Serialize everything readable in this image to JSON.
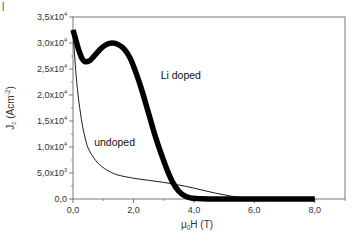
{
  "chart_data": {
    "type": "line",
    "title": "",
    "xlabel": "μ0H (T)",
    "xlabel_parts": {
      "base": "μ",
      "sub": "0",
      "rest": "H (T)"
    },
    "ylabel": "Jc (Acm-2)",
    "ylabel_parts": {
      "base": "J",
      "sub": "c",
      "mid": " (Acm",
      "sup": "-2",
      "end": ")"
    },
    "xlim": [
      0,
      9
    ],
    "ylim": [
      0,
      35000
    ],
    "grid": false,
    "legend": "none (inline annotations)",
    "x_ticks": [
      {
        "value": 0,
        "label": "0,0"
      },
      {
        "value": 2,
        "label": "2,0"
      },
      {
        "value": 4,
        "label": "4,0"
      },
      {
        "value": 6,
        "label": "6,0"
      },
      {
        "value": 8,
        "label": "8,0"
      }
    ],
    "y_ticks": [
      {
        "value": 0,
        "mant": "0,0",
        "exp": ""
      },
      {
        "value": 5000,
        "mant": "5,0x10",
        "exp": "3"
      },
      {
        "value": 10000,
        "mant": "1,0x10",
        "exp": "4"
      },
      {
        "value": 15000,
        "mant": "1,5x10",
        "exp": "4"
      },
      {
        "value": 20000,
        "mant": "2,0x10",
        "exp": "4"
      },
      {
        "value": 25000,
        "mant": "2,5x10",
        "exp": "4"
      },
      {
        "value": 30000,
        "mant": "3,0x10",
        "exp": "4"
      },
      {
        "value": 35000,
        "mant": "3,5x10",
        "exp": "4"
      }
    ],
    "series": [
      {
        "name": "Li doped",
        "style": "thick",
        "x": [
          0.0,
          0.1,
          0.2,
          0.3,
          0.4,
          0.55,
          0.7,
          0.9,
          1.1,
          1.3,
          1.5,
          1.7,
          1.9,
          2.1,
          2.3,
          2.5,
          2.7,
          2.9,
          3.1,
          3.3,
          3.5,
          3.7,
          3.9,
          4.1,
          4.5,
          5.0,
          6.0,
          7.0,
          8.0
        ],
        "values": [
          32500,
          30500,
          28500,
          27000,
          26400,
          26600,
          27500,
          28800,
          29700,
          30000,
          29700,
          28800,
          27000,
          24000,
          20500,
          16500,
          12500,
          9000,
          5800,
          3200,
          1500,
          600,
          200,
          80,
          20,
          0,
          0,
          0,
          0
        ]
      },
      {
        "name": "undoped",
        "style": "thin",
        "x": [
          0.0,
          0.05,
          0.1,
          0.15,
          0.2,
          0.3,
          0.4,
          0.5,
          0.7,
          0.9,
          1.2,
          1.5,
          2.0,
          2.5,
          3.0,
          3.5,
          4.0,
          4.5,
          5.0,
          5.5,
          6.0,
          7.0,
          8.0
        ],
        "values": [
          32500,
          28000,
          24000,
          21000,
          18500,
          14500,
          11800,
          9800,
          7800,
          6500,
          5300,
          4600,
          4000,
          3600,
          3200,
          2700,
          2100,
          1400,
          800,
          300,
          80,
          0,
          0
        ]
      }
    ],
    "annotations": [
      {
        "text": "Li doped",
        "x": 2.9,
        "y": 23000
      },
      {
        "text": "undoped",
        "x": 0.7,
        "y": 10200
      }
    ]
  },
  "panel_label": "|"
}
